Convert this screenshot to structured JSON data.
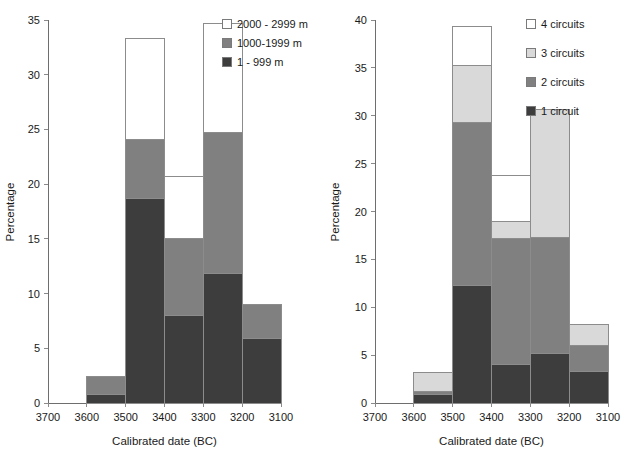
{
  "figure": {
    "width": 626,
    "height": 461,
    "background": "#ffffff"
  },
  "chart_data": [
    {
      "id": "left",
      "type": "bar",
      "subtype": "stacked-histogram",
      "title": "",
      "xlabel": "Calibrated date (BC)",
      "ylabel": "Percentage",
      "categories": [
        "3700",
        "3600",
        "3500",
        "3400",
        "3300",
        "3200",
        "3100"
      ],
      "bin_labels": [
        "3700-3600",
        "3600-3500",
        "3500-3400",
        "3400-3300",
        "3300-3200",
        "3200-3100"
      ],
      "xtick_labels": [
        "3700",
        "3600",
        "3500",
        "3400",
        "3300",
        "3200",
        "3100"
      ],
      "ytick_labels": [
        "0",
        "5",
        "10",
        "15",
        "20",
        "25",
        "30",
        "35"
      ],
      "ylim": [
        0,
        35
      ],
      "ytick_step": 5,
      "xlim": [
        3700,
        3100
      ],
      "grid": false,
      "legend_position": "top-right",
      "series": [
        {
          "name": "1 - 999 m",
          "color": "#3d3d3d",
          "values": [
            0.0,
            0.8,
            18.7,
            8.0,
            11.8,
            5.9
          ]
        },
        {
          "name": "1000-1999 m",
          "color": "#808080",
          "values": [
            0.0,
            1.6,
            5.4,
            7.0,
            12.9,
            3.1
          ]
        },
        {
          "name": "2000 - 2999 m",
          "color": "#ffffff",
          "values": [
            0.0,
            0.0,
            9.2,
            5.7,
            10.0,
            0.0
          ]
        }
      ],
      "stack_totals": [
        0.0,
        2.4,
        33.3,
        20.7,
        34.7,
        9.0
      ],
      "legend": [
        {
          "label": "2000 - 2999 m",
          "color": "#ffffff"
        },
        {
          "label": "1000-1999 m",
          "color": "#808080"
        },
        {
          "label": "1 - 999 m",
          "color": "#3d3d3d"
        }
      ]
    },
    {
      "id": "right",
      "type": "bar",
      "subtype": "stacked-histogram",
      "title": "",
      "xlabel": "Calibrated date (BC)",
      "ylabel": "Percentage",
      "categories": [
        "3700",
        "3600",
        "3500",
        "3400",
        "3300",
        "3200",
        "3100"
      ],
      "bin_labels": [
        "3700-3600",
        "3600-3500",
        "3500-3400",
        "3400-3300",
        "3300-3200",
        "3200-3100"
      ],
      "xtick_labels": [
        "3700",
        "3600",
        "3500",
        "3400",
        "3300",
        "3200",
        "3100"
      ],
      "ytick_labels": [
        "0",
        "5",
        "10",
        "15",
        "20",
        "25",
        "30",
        "35",
        "40"
      ],
      "ylim": [
        0,
        40
      ],
      "ytick_step": 5,
      "xlim": [
        3700,
        3100
      ],
      "grid": false,
      "legend_position": "top-right",
      "series": [
        {
          "name": "1 circuit",
          "color": "#3d3d3d",
          "values": [
            0.0,
            0.85,
            12.3,
            4.0,
            5.2,
            3.3
          ]
        },
        {
          "name": "2 circuits",
          "color": "#808080",
          "values": [
            0.0,
            0.35,
            17.0,
            13.2,
            12.1,
            2.7
          ]
        },
        {
          "name": "3 circuits",
          "color": "#d9d9d9",
          "values": [
            0.0,
            2.0,
            6.0,
            1.8,
            13.4,
            2.2
          ]
        },
        {
          "name": "4 circuits",
          "color": "#ffffff",
          "values": [
            0.0,
            0.0,
            4.0,
            4.8,
            0.0,
            0.0
          ]
        }
      ],
      "stack_totals": [
        0.0,
        3.2,
        39.3,
        23.8,
        30.7,
        8.2
      ],
      "legend": [
        {
          "label": "4 circuits",
          "color": "#ffffff"
        },
        {
          "label": "3 circuits",
          "color": "#d9d9d9"
        },
        {
          "label": "2 circuits",
          "color": "#808080"
        },
        {
          "label": "1 circuit",
          "color": "#3d3d3d"
        }
      ]
    }
  ]
}
